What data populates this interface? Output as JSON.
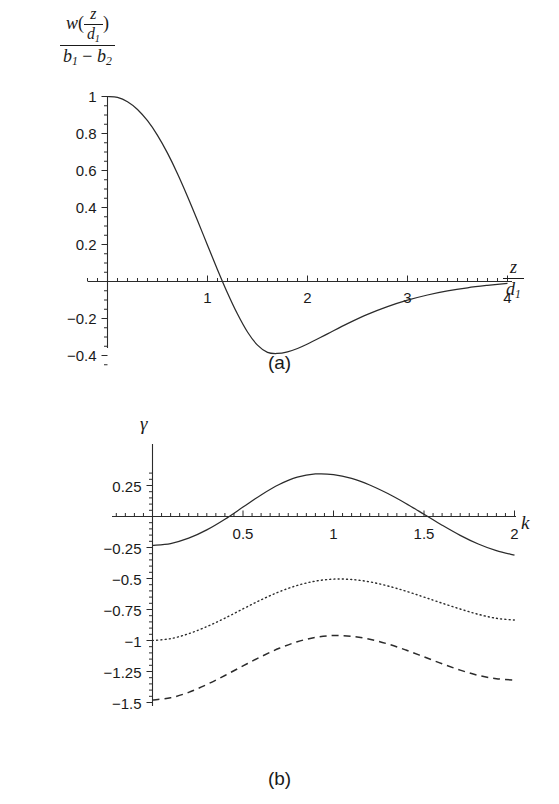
{
  "figure": {
    "background": "#ffffff",
    "ink_color": "#2b2b2b"
  },
  "panel_a": {
    "caption": "(a)",
    "ylabel_numerator_fn": "w",
    "ylabel_numerator_arg_num": "z",
    "ylabel_numerator_arg_den": "d",
    "ylabel_numerator_arg_den_sub": "1",
    "ylabel_den_b1": "b",
    "ylabel_den_b1_sub": "1",
    "ylabel_den_minus": "−",
    "ylabel_den_b2": "b",
    "ylabel_den_b2_sub": "2",
    "xlabel_num": "z",
    "xlabel_den": "d",
    "xlabel_den_sub": "1",
    "ytick_labels": [
      "1",
      "0.8",
      "0.6",
      "0.4",
      "0.2",
      "−0.2",
      "−0.4"
    ],
    "xtick_labels": [
      "1",
      "2",
      "3",
      "4"
    ]
  },
  "panel_b": {
    "caption": "(b)",
    "ylabel": "γ",
    "xlabel": "k",
    "ytick_labels": [
      "0.25",
      "−0.25",
      "−0.5",
      "−0.75",
      "−1",
      "−1.25",
      "−1.5"
    ],
    "xtick_labels": [
      "0.5",
      "1",
      "1.5",
      "2"
    ],
    "legend": [
      {
        "style": "dotted",
        "label_p": "P",
        "label_eq": " = ",
        "label_val": "0",
        "text": "P = 0"
      },
      {
        "style": "dashed",
        "label_p": "P",
        "label_eq": " = ",
        "label_val": "1",
        "text": "P = 1"
      },
      {
        "style": "solid",
        "label_p": "P",
        "label_eq": " = ",
        "label_val": "0.5",
        "text": "P = 0.5"
      }
    ]
  },
  "chart_data": [
    {
      "type": "line",
      "id": "panel-a",
      "title": "(a)",
      "xlabel": "z/d_1",
      "ylabel": "w(z/d_1)/(b_1 - b_2)",
      "xlim": [
        0,
        4.15
      ],
      "ylim": [
        -0.45,
        1.05
      ],
      "xticks_major": [
        1,
        2,
        3,
        4
      ],
      "yticks_major": [
        1,
        0.8,
        0.6,
        0.4,
        0.2,
        -0.2,
        -0.4
      ],
      "grid": false,
      "legend": null,
      "series": [
        {
          "name": "w(z/d1)/(b1-b2)",
          "style": "solid",
          "x": [
            0,
            0.1,
            0.2,
            0.3,
            0.4,
            0.5,
            0.6,
            0.7,
            0.8,
            0.9,
            1.0,
            1.1,
            1.2,
            1.3,
            1.4,
            1.5,
            1.6,
            1.7,
            1.8,
            1.9,
            2.0,
            2.2,
            2.4,
            2.6,
            2.8,
            3.0,
            3.2,
            3.4,
            3.6,
            3.8,
            4.0
          ],
          "y": [
            1.0,
            0.995,
            0.972,
            0.93,
            0.869,
            0.79,
            0.694,
            0.583,
            0.46,
            0.33,
            0.196,
            0.064,
            -0.062,
            -0.176,
            -0.273,
            -0.344,
            -0.383,
            -0.389,
            -0.38,
            -0.362,
            -0.338,
            -0.283,
            -0.228,
            -0.178,
            -0.136,
            -0.101,
            -0.073,
            -0.051,
            -0.034,
            -0.021,
            -0.01
          ]
        }
      ]
    },
    {
      "type": "line",
      "id": "panel-b",
      "title": "(b)",
      "xlabel": "k",
      "ylabel": "γ",
      "xlim": [
        0,
        2.08
      ],
      "ylim": [
        -1.52,
        0.42
      ],
      "xticks_major": [
        0.5,
        1,
        1.5,
        2
      ],
      "yticks_major": [
        0.25,
        -0.25,
        -0.5,
        -0.75,
        -1,
        -1.25,
        -1.5
      ],
      "grid": false,
      "legend_position": "inside-bottom-center",
      "series": [
        {
          "name": "P = 0",
          "style": "dotted",
          "x": [
            0,
            0.1,
            0.2,
            0.3,
            0.4,
            0.5,
            0.6,
            0.7,
            0.8,
            0.9,
            1.0,
            1.1,
            1.2,
            1.3,
            1.4,
            1.5,
            1.6,
            1.7,
            1.8,
            1.9,
            2.0
          ],
          "y": [
            -1.0,
            -0.985,
            -0.945,
            -0.888,
            -0.82,
            -0.745,
            -0.672,
            -0.607,
            -0.556,
            -0.521,
            -0.505,
            -0.508,
            -0.527,
            -0.56,
            -0.602,
            -0.65,
            -0.699,
            -0.746,
            -0.789,
            -0.821,
            -0.835
          ]
        },
        {
          "name": "P = 1",
          "style": "dashed",
          "x": [
            0,
            0.1,
            0.2,
            0.3,
            0.4,
            0.5,
            0.6,
            0.7,
            0.8,
            0.9,
            1.0,
            1.1,
            1.2,
            1.3,
            1.4,
            1.5,
            1.6,
            1.7,
            1.8,
            1.9,
            2.0
          ],
          "y": [
            -1.48,
            -1.462,
            -1.418,
            -1.355,
            -1.282,
            -1.205,
            -1.13,
            -1.063,
            -1.01,
            -0.975,
            -0.96,
            -0.966,
            -0.99,
            -1.028,
            -1.077,
            -1.132,
            -1.188,
            -1.239,
            -1.281,
            -1.308,
            -1.32
          ]
        },
        {
          "name": "P = 0.5",
          "style": "solid",
          "x": [
            0,
            0.1,
            0.2,
            0.3,
            0.4,
            0.5,
            0.6,
            0.7,
            0.8,
            0.9,
            1.0,
            1.1,
            1.2,
            1.3,
            1.4,
            1.5,
            1.6,
            1.7,
            1.8,
            1.9,
            2.0
          ],
          "y": [
            -0.232,
            -0.218,
            -0.175,
            -0.108,
            -0.022,
            0.076,
            0.174,
            0.258,
            0.317,
            0.343,
            0.338,
            0.307,
            0.254,
            0.185,
            0.105,
            0.018,
            -0.07,
            -0.152,
            -0.222,
            -0.276,
            -0.312
          ]
        }
      ]
    }
  ]
}
